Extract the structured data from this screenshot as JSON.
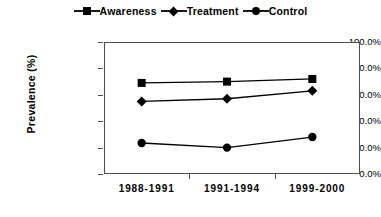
{
  "chart_data": {
    "type": "line",
    "title": "",
    "xlabel": "",
    "ylabel": "Prevalence  (%)",
    "categories": [
      "1988-1991",
      "1991-1994",
      "1999-2000"
    ],
    "ylim": [
      0,
      100
    ],
    "ytick_labels": [
      "100.0%",
      "80.0%",
      "60.0%",
      "40.0%",
      "20.0%",
      "0.0%"
    ],
    "ytick_values": [
      100,
      80,
      60,
      40,
      20,
      0
    ],
    "grid": false,
    "legend_position": "top-center",
    "series": [
      {
        "name": "Awareness",
        "marker": "square",
        "color": "#000000",
        "values": [
          69,
          70,
          72
        ]
      },
      {
        "name": "Treatment",
        "marker": "diamond",
        "color": "#000000",
        "values": [
          55,
          57,
          63
        ]
      },
      {
        "name": "Control",
        "marker": "circle",
        "color": "#000000",
        "values": [
          23.5,
          20,
          28
        ]
      }
    ]
  },
  "legend": {
    "entries": [
      {
        "label": "Awareness",
        "marker": "square-marker-icon"
      },
      {
        "label": "Treatment",
        "marker": "diamond-marker-icon"
      },
      {
        "label": "Control",
        "marker": "circle-marker-icon"
      }
    ]
  },
  "axes": {
    "y": {
      "title": "Prevalence  (%)",
      "ticks": [
        "100.0%",
        "80.0%",
        "60.0%",
        "40.0%",
        "20.0%",
        "0.0%"
      ]
    },
    "x": {
      "ticks": [
        "1988-1991",
        "1991-1994",
        "1999-2000"
      ]
    }
  },
  "colors": {
    "series": "#000000",
    "axis": "#4d4d4d",
    "background": "#ffffff"
  }
}
